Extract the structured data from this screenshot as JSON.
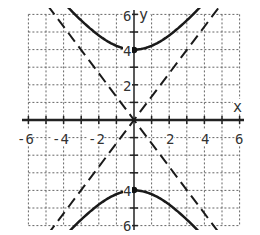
{
  "chart_data": {
    "type": "line",
    "title": "",
    "xlabel": "x",
    "ylabel": "y",
    "xlim": [
      -6,
      6
    ],
    "ylim": [
      -6,
      6
    ],
    "grid": true,
    "grid_style": "dotted",
    "x_ticks": [
      -6,
      -4,
      -2,
      2,
      4,
      6
    ],
    "y_ticks": [
      6,
      4,
      2,
      -4,
      -6
    ],
    "x_tick_labels": [
      "-6",
      "-4",
      "-2",
      "2",
      "4",
      "6"
    ],
    "y_tick_labels": [
      "6",
      "4",
      "2",
      "4",
      "6"
    ],
    "series": [
      {
        "name": "hyperbola upper branch",
        "style": "solid",
        "equation": "y = 4*sqrt(1 + x^2/9)",
        "vertex": [
          0,
          4
        ]
      },
      {
        "name": "hyperbola lower branch",
        "style": "solid",
        "equation": "y = -4*sqrt(1 + x^2/9)",
        "vertex": [
          0,
          -4
        ]
      },
      {
        "name": "asymptote positive",
        "style": "dashed",
        "equation": "y = (4/3)x"
      },
      {
        "name": "asymptote negative",
        "style": "dashed",
        "equation": "y = -(4/3)x"
      }
    ],
    "points": [
      {
        "label": "vertex upper",
        "x": 0,
        "y": 4
      },
      {
        "label": "vertex lower",
        "x": 0,
        "y": -4
      }
    ]
  },
  "colors": {
    "curve": "#1a1a1a",
    "grid": "#555555",
    "axis": "#222222",
    "background": "#ffffff"
  },
  "labels": {
    "x_axis": "x",
    "y_axis": "y",
    "xt": [
      "-6",
      "-4",
      "-2",
      "2",
      "4",
      "6"
    ],
    "yt_top6": "6",
    "yt_top4": "4",
    "yt_top2": "2",
    "yt_bot4": "4",
    "yt_bot6": "6"
  }
}
